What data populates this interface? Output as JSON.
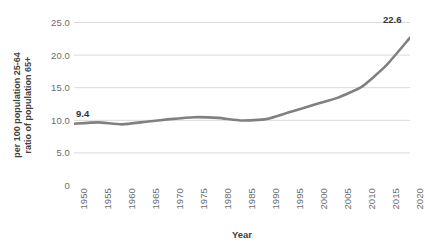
{
  "chart_data": {
    "type": "line",
    "title": "",
    "xlabel": "Year",
    "ylabel_lines": [
      "ratio of population 65+",
      "per 100 population 25-64"
    ],
    "ylabel": "ratio of population 65+ per 100 population 25-64",
    "x": [
      1950,
      1955,
      1960,
      1965,
      1970,
      1975,
      1980,
      1985,
      1990,
      1995,
      2000,
      2005,
      2010,
      2015,
      2020
    ],
    "values": [
      9.4,
      9.6,
      9.3,
      9.7,
      10.1,
      10.4,
      10.3,
      9.9,
      10.1,
      11.2,
      12.3,
      13.4,
      15.1,
      18.3,
      22.6
    ],
    "series": [
      {
        "name": "ratio of population 65+ per 100 population 25-64",
        "values": [
          9.4,
          9.6,
          9.3,
          9.7,
          10.1,
          10.4,
          10.3,
          9.9,
          10.1,
          11.2,
          12.3,
          13.4,
          15.1,
          18.3,
          22.6
        ],
        "color": "#808080"
      }
    ],
    "x_tick_labels": [
      "1950",
      "1955",
      "1960",
      "1965",
      "1970",
      "1975",
      "1980",
      "1985",
      "1990",
      "1995",
      "2000",
      "2005",
      "2010",
      "2015",
      "2020"
    ],
    "y_tick_labels": [
      "25.0",
      "20.0",
      "15.0",
      "10.0",
      "5.0",
      "0"
    ],
    "y_tick_values": [
      25.0,
      20.0,
      15.0,
      10.0,
      5.0,
      0
    ],
    "xlim": [
      1950,
      2020
    ],
    "ylim": [
      0,
      25
    ],
    "grid": "horizontal",
    "legend": "none",
    "point_labels": [
      {
        "name": "start-value",
        "text": "9.4",
        "x": 1950,
        "y": 9.4
      },
      {
        "name": "end-value",
        "text": "22.6",
        "x": 2020,
        "y": 22.6
      }
    ],
    "colors": {
      "line": "#808080",
      "gridline": "#d9d9d9",
      "axis_text": "#6b6b6b",
      "title_text": "#404040",
      "label_text": "#333333",
      "background": "#ffffff"
    }
  }
}
